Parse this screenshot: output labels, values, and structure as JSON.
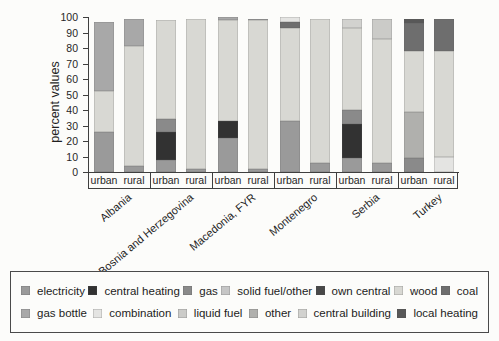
{
  "chart_data": {
    "type": "bar",
    "stacked": true,
    "title": "",
    "ylabel": "percent values",
    "ylim": [
      0,
      100
    ],
    "yticks": [
      0,
      10,
      20,
      30,
      40,
      50,
      60,
      70,
      80,
      90,
      100
    ],
    "grid": false,
    "legend_position": "bottom-box",
    "categories_note": "x axis = urban/rural pairs grouped by country",
    "area_labels": [
      "urban",
      "rural"
    ],
    "groups": [
      "Albania",
      "Bosnia and Herzegovina",
      "Macedonia, FYR",
      "Montenegro",
      "Serbia",
      "Turkey"
    ],
    "legend": {
      "rows": [
        [
          {
            "label": "electricity",
            "color": "#9a9a9a"
          },
          {
            "label": "central heating",
            "color": "#323232"
          },
          {
            "label": "gas",
            "color": "#8a8a8a"
          },
          {
            "label": "solid fuel/other",
            "color": "#c6c6c6"
          },
          {
            "label": "own central",
            "color": "#484848"
          },
          {
            "label": "wood",
            "color": "#d8d8d3"
          },
          {
            "label": "coal",
            "color": "#6e6e6e"
          }
        ],
        [
          {
            "label": "gas bottle",
            "color": "#a8a8a8"
          },
          {
            "label": "combination",
            "color": "#e4e4e2"
          },
          {
            "label": "liquid fuel",
            "color": "#cbcbc8"
          },
          {
            "label": "other",
            "color": "#b0b0ad"
          },
          {
            "label": "central building",
            "color": "#d2d2cf"
          },
          {
            "label": "local heating",
            "color": "#585858"
          }
        ]
      ]
    },
    "bars": [
      {
        "group": "Albania",
        "area": "urban",
        "segments": [
          {
            "category": "electricity",
            "value": 26
          },
          {
            "category": "wood",
            "value": 26
          },
          {
            "category": "gas bottle",
            "value": 45
          }
        ]
      },
      {
        "group": "Albania",
        "area": "rural",
        "segments": [
          {
            "category": "electricity",
            "value": 4
          },
          {
            "category": "wood",
            "value": 77
          },
          {
            "category": "gas bottle",
            "value": 18
          }
        ]
      },
      {
        "group": "Bosnia and Herzegovina",
        "area": "urban",
        "segments": [
          {
            "category": "electricity",
            "value": 8
          },
          {
            "category": "central heating",
            "value": 18
          },
          {
            "category": "gas",
            "value": 8
          },
          {
            "category": "wood",
            "value": 64
          }
        ]
      },
      {
        "group": "Bosnia and Herzegovina",
        "area": "rural",
        "segments": [
          {
            "category": "electricity",
            "value": 2
          },
          {
            "category": "wood",
            "value": 97
          }
        ]
      },
      {
        "group": "Macedonia, FYR",
        "area": "urban",
        "segments": [
          {
            "category": "electricity",
            "value": 22
          },
          {
            "category": "central heating",
            "value": 11
          },
          {
            "category": "wood",
            "value": 65
          },
          {
            "category": "gas bottle",
            "value": 2
          }
        ]
      },
      {
        "group": "Macedonia, FYR",
        "area": "rural",
        "segments": [
          {
            "category": "electricity",
            "value": 2
          },
          {
            "category": "wood",
            "value": 96
          },
          {
            "category": "gas bottle",
            "value": 1
          }
        ]
      },
      {
        "group": "Montenegro",
        "area": "urban",
        "segments": [
          {
            "category": "electricity",
            "value": 33
          },
          {
            "category": "wood",
            "value": 60
          },
          {
            "category": "coal",
            "value": 4
          },
          {
            "category": "combination",
            "value": 3
          }
        ]
      },
      {
        "group": "Montenegro",
        "area": "rural",
        "segments": [
          {
            "category": "electricity",
            "value": 6
          },
          {
            "category": "wood",
            "value": 93
          }
        ]
      },
      {
        "group": "Serbia",
        "area": "urban",
        "segments": [
          {
            "category": "electricity",
            "value": 9
          },
          {
            "category": "central heating",
            "value": 22
          },
          {
            "category": "gas",
            "value": 9
          },
          {
            "category": "wood",
            "value": 53
          },
          {
            "category": "central building",
            "value": 6
          }
        ]
      },
      {
        "group": "Serbia",
        "area": "rural",
        "segments": [
          {
            "category": "electricity",
            "value": 6
          },
          {
            "category": "wood",
            "value": 80
          },
          {
            "category": "liquid fuel",
            "value": 13
          }
        ]
      },
      {
        "group": "Turkey",
        "area": "urban",
        "segments": [
          {
            "category": "gas",
            "value": 9
          },
          {
            "category": "other",
            "value": 30
          },
          {
            "category": "wood",
            "value": 39
          },
          {
            "category": "coal",
            "value": 18
          },
          {
            "category": "local heating",
            "value": 3
          }
        ]
      },
      {
        "group": "Turkey",
        "area": "rural",
        "segments": [
          {
            "category": "combination",
            "value": 10
          },
          {
            "category": "wood",
            "value": 68
          },
          {
            "category": "coal",
            "value": 21
          }
        ]
      }
    ]
  }
}
